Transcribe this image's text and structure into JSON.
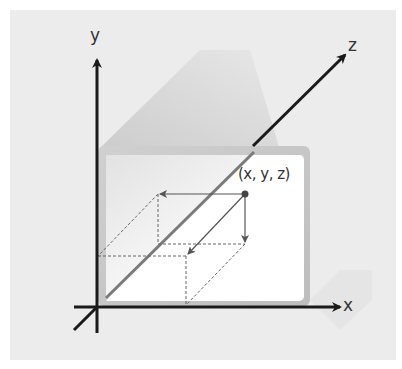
{
  "diagram": {
    "colors": {
      "background": "#ffffff",
      "panel": "#ececec",
      "shadow": "#d6d6d6",
      "frame": "#c8c8c8",
      "screen": "#ffffff",
      "axis": "#1a1a1a",
      "guide": "#555555",
      "point": "#444444"
    },
    "axes": {
      "x": {
        "label": "x"
      },
      "y": {
        "label": "y"
      },
      "z": {
        "label": "z"
      }
    },
    "point": {
      "label": "(x, y, z)"
    }
  }
}
